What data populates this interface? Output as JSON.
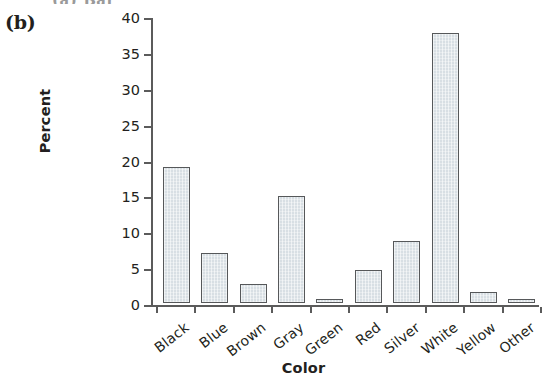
{
  "figure": {
    "panel_label": "(b)",
    "top_cut_fragment": "(a) Bar"
  },
  "chart_data": {
    "type": "bar",
    "title": "",
    "xlabel": "Color",
    "ylabel": "Percent",
    "categories": [
      "Black",
      "Blue",
      "Brown",
      "Gray",
      "Green",
      "Red",
      "Silver",
      "White",
      "Yellow",
      "Other"
    ],
    "values": [
      19.0,
      7.0,
      2.7,
      14.9,
      0.6,
      4.6,
      8.6,
      37.7,
      1.6,
      0.5
    ],
    "ylim": [
      0,
      40
    ],
    "yticks": [
      0,
      5,
      10,
      15,
      20,
      25,
      30,
      35,
      40
    ],
    "ytick_labels": [
      "0",
      "5",
      "10",
      "15",
      "20",
      "25",
      "30",
      "35",
      "40"
    ],
    "grid": false,
    "legend": "none",
    "bar_fill_color": "#d8dfe4",
    "bar_edge_color": "#56585a",
    "axis_color": "#5b5b5b"
  }
}
